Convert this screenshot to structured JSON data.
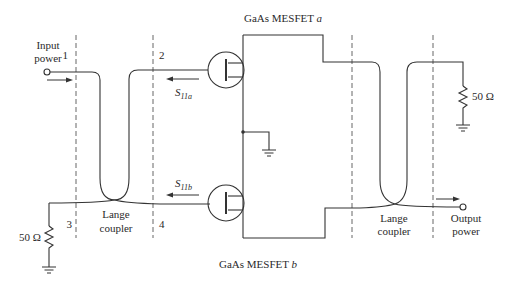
{
  "diagram": {
    "title_top": "GaAs MESFET",
    "title_top_suffix": "a",
    "title_bottom": "GaAs MESFET",
    "title_bottom_suffix": "b",
    "input": {
      "line1": "Input",
      "line2": "power"
    },
    "output": {
      "line1": "Output",
      "line2": "power"
    },
    "ports": [
      "1",
      "2",
      "3",
      "4"
    ],
    "left_coupler": {
      "line1": "Lange",
      "line2": "coupler"
    },
    "right_coupler": {
      "line1": "Lange",
      "line2": "coupler"
    },
    "s11a": {
      "main": "S",
      "sub": "11a"
    },
    "s11b": {
      "main": "S",
      "sub": "11b"
    },
    "resistor_left": "50 Ω",
    "resistor_right": "50 Ω"
  }
}
